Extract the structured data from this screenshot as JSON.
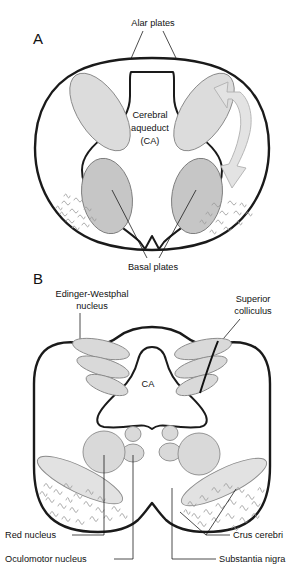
{
  "figure": {
    "title_visible": false,
    "background_color": "#ffffff",
    "ink_color": "#111111"
  },
  "panels": [
    {
      "letter": "A",
      "letter_pos": {
        "x": 33,
        "y": 44
      },
      "description": "Embryonic midbrain cross-section showing alar and basal plates around the cerebral aqueduct",
      "labels": [
        {
          "name": "alar-plates",
          "text": "Alar plates",
          "x": 153,
          "y": 26,
          "anchor": "middle"
        },
        {
          "name": "cerebral-aqueduct",
          "text": [
            "Cerebral",
            "aqueduct",
            "(CA)"
          ],
          "x": 150,
          "y": 118,
          "anchor": "middle"
        },
        {
          "name": "basal-plates",
          "text": "Basal plates",
          "x": 153,
          "y": 264,
          "anchor": "middle"
        }
      ],
      "colors": {
        "alar_fill": "#dcdcdc",
        "basal_fill": "#c6c6c6",
        "arrow_fill": "#e3e3e3",
        "outline": "#1a1a1a"
      }
    },
    {
      "letter": "B",
      "letter_pos": {
        "x": 33,
        "y": 284
      },
      "description": "Adult midbrain cross-section at level of superior colliculus",
      "labels": [
        {
          "name": "edinger-westphal-nucleus",
          "text": [
            "Edinger-Westphal",
            "nucleus"
          ],
          "x": 92,
          "y": 297,
          "anchor": "middle"
        },
        {
          "name": "superior-colliculus",
          "text": [
            "Superior",
            "colliculus"
          ],
          "x": 253,
          "y": 302,
          "anchor": "middle"
        },
        {
          "name": "ca-center",
          "text": "CA",
          "x": 148,
          "y": 384,
          "anchor": "middle"
        },
        {
          "name": "red-nucleus",
          "text": "Red nucleus",
          "x": 5,
          "y": 538,
          "anchor": "start"
        },
        {
          "name": "oculomotor-nucleus",
          "text": "Oculomotor nucleus",
          "x": 5,
          "y": 562,
          "anchor": "start"
        },
        {
          "name": "crus-cerebri",
          "text": "Crus cerebri",
          "x": 233,
          "y": 538,
          "anchor": "start"
        },
        {
          "name": "substantia-nigra",
          "text": "Substantia nigra",
          "x": 219,
          "y": 562,
          "anchor": "start"
        }
      ],
      "colors": {
        "nucleus_fill": "#d9d9d9",
        "crus_fill": "#e2e2e2",
        "outline": "#1a1a1a"
      }
    }
  ],
  "anatomy_terms": [
    "Alar plates",
    "Cerebral aqueduct (CA)",
    "Basal plates",
    "Edinger-Westphal nucleus",
    "Superior colliculus",
    "Red nucleus",
    "Oculomotor nucleus",
    "Crus cerebri",
    "Substantia nigra"
  ]
}
